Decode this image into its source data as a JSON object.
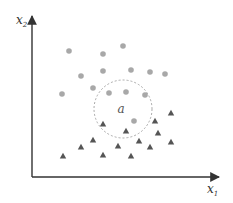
{
  "diagram": {
    "axes": {
      "x_label": "x",
      "x_subscript": "1",
      "y_label": "x",
      "y_subscript": "2",
      "origin": [
        32,
        177
      ],
      "x_end": 219,
      "y_end": 16,
      "color": "#333333"
    },
    "query_point": {
      "label": "a",
      "center": [
        123,
        109
      ],
      "radius": 29,
      "circle_style": "dashed",
      "circle_color": "#aaaaaa"
    },
    "class_circle": {
      "shape": "circle",
      "color": "#a8a8a8",
      "points": [
        [
          69,
          51
        ],
        [
          103,
          54
        ],
        [
          123,
          46
        ],
        [
          81,
          76
        ],
        [
          103,
          71
        ],
        [
          131,
          70
        ],
        [
          150,
          72
        ],
        [
          165,
          74
        ],
        [
          93,
          88
        ],
        [
          62,
          94
        ],
        [
          109,
          93
        ],
        [
          126,
          92
        ],
        [
          145,
          95
        ],
        [
          134,
          121
        ]
      ]
    },
    "class_triangle": {
      "shape": "triangle",
      "color": "#555555",
      "points": [
        [
          63,
          156
        ],
        [
          81,
          147
        ],
        [
          93,
          140
        ],
        [
          103,
          124
        ],
        [
          103,
          155
        ],
        [
          118,
          146
        ],
        [
          126,
          131
        ],
        [
          131,
          156
        ],
        [
          139,
          141
        ],
        [
          150,
          147
        ],
        [
          155,
          121
        ],
        [
          158,
          133
        ],
        [
          171,
          113
        ],
        [
          171,
          142
        ]
      ]
    }
  }
}
